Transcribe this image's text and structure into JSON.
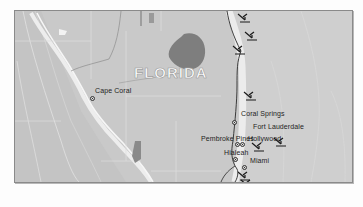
{
  "map": {
    "region": "South Florida",
    "state_label": "FLORIDA",
    "colors": {
      "land": "#c9c9c9",
      "water_ocean": "#d2d2d2",
      "lake": "#7f7f7f",
      "coast_highlight": "#ececec",
      "roads": "#333333",
      "county_lines": "#dedede",
      "frame_border": "#8a8a8a"
    },
    "cities": [
      {
        "name": "Cape Coral",
        "label_x": 80,
        "label_y": 74,
        "marker_x": 74,
        "marker_y": 83
      },
      {
        "name": "Coral Springs",
        "label_x": 225,
        "label_y": 110,
        "marker_x": 217,
        "marker_y": 118
      },
      {
        "name": "Fort Lauderdale",
        "label_x": 236,
        "label_y": 124,
        "marker_x": null,
        "marker_y": null
      },
      {
        "name": "Pembroke Pines",
        "label_x": 184,
        "label_y": 135,
        "marker_x": null,
        "marker_y": null
      },
      {
        "name": "Hollywood",
        "label_x": 232,
        "label_y": 135,
        "marker_x": null,
        "marker_y": null
      },
      {
        "name": "Hialeah",
        "label_x": 208,
        "label_y": 147,
        "marker_x": 217,
        "marker_y": 155
      },
      {
        "name": "Miami",
        "label_x": 232,
        "label_y": 155,
        "marker_x": null,
        "marker_y": null
      }
    ],
    "airports": [
      {
        "name": "airport-1",
        "x": 236,
        "y": 9
      },
      {
        "name": "airport-2",
        "x": 243,
        "y": 27
      },
      {
        "name": "airport-3",
        "x": 231,
        "y": 41
      },
      {
        "name": "airport-4",
        "x": 242,
        "y": 86
      },
      {
        "name": "airport-5",
        "x": 249,
        "y": 136
      },
      {
        "name": "airport-6",
        "x": 270,
        "y": 131
      },
      {
        "name": "airport-7",
        "x": 235,
        "y": 166
      },
      {
        "name": "airport-8",
        "x": 237,
        "y": 178
      }
    ]
  }
}
